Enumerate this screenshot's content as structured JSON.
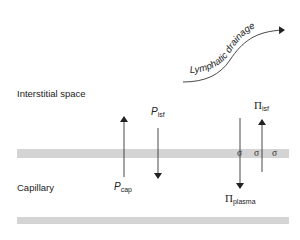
{
  "regions": {
    "interstitial": "Interstitial space",
    "capillary": "Capillary"
  },
  "lymphatic": {
    "label": "Lymphatic drainage"
  },
  "forces": {
    "p_cap": {
      "base": "P",
      "sub": "cap",
      "direction": "up"
    },
    "p_isf": {
      "base": "P",
      "sub": "isf",
      "direction": "down"
    },
    "pi_plasma": {
      "base": "Π",
      "sub": "plasma",
      "direction": "down"
    },
    "pi_isf": {
      "base": "Π",
      "sub": "isf",
      "direction": "up"
    }
  },
  "reflection": {
    "sigma1": "σ",
    "sigma2": "σ",
    "sigma3": "σ"
  },
  "colors": {
    "wall": "#d4d4d4",
    "ink": "#222222"
  }
}
